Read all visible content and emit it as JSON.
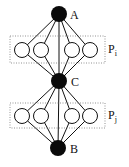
{
  "diagram": {
    "hubs": [
      {
        "id": "A",
        "label": "A",
        "cx": 59,
        "cy": 14,
        "r": 8
      },
      {
        "id": "C",
        "label": "C",
        "cx": 59,
        "cy": 81,
        "r": 8
      },
      {
        "id": "B",
        "label": "B",
        "cx": 58,
        "cy": 148,
        "r": 8
      }
    ],
    "groups": [
      {
        "id": "Pi",
        "label": "P",
        "subscript": "i",
        "box": {
          "x": 10,
          "y": 36,
          "w": 95,
          "h": 27
        },
        "nodes_y": 50,
        "nodes_x": [
          22,
          41,
          72,
          90
        ],
        "from": "A",
        "to": "C"
      },
      {
        "id": "Pj",
        "label": "P",
        "subscript": "j",
        "box": {
          "x": 10,
          "y": 103,
          "w": 95,
          "h": 25
        },
        "nodes_y": 116,
        "nodes_x": [
          22,
          41,
          72,
          90
        ],
        "from": "C",
        "to": "B"
      }
    ],
    "inner_radius": 7.5,
    "colors": {
      "hub": "#0a0a0a",
      "edge": "#111111",
      "box": "#777777"
    }
  }
}
